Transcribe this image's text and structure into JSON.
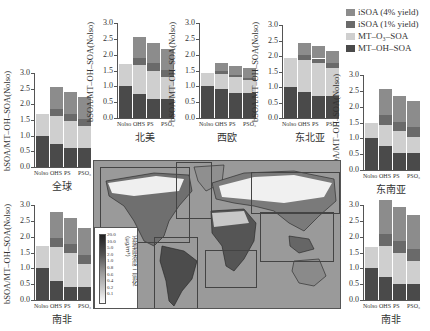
{
  "legend": {
    "items": [
      {
        "label": "iSOA (4% yield)",
        "color": "#8c8c8c"
      },
      {
        "label": "iSOA (1% yield)",
        "color": "#6a6a6a"
      },
      {
        "label": "MT–O₃–SOA",
        "color": "#cfcfcf"
      },
      {
        "label": "MT–OH–SOA",
        "color": "#4a4a4a"
      }
    ]
  },
  "axis": {
    "ylabel": "bSOA/MT–OH–SOA(Nolso)",
    "ylabel_alt": "BSOA/MT–OH–SOA(Nolso)",
    "yticks": [
      "0.0",
      "0.5",
      "1.0",
      "1.5",
      "2.0",
      "2.5",
      "3.0"
    ],
    "xticks": [
      "Nolso",
      "OHS",
      "PS",
      "PSO₃"
    ]
  },
  "map": {
    "colorbar_ticks": [
      "20.0",
      "10.0",
      "5.0",
      "2.0",
      "1.0",
      "0.8",
      "0.6",
      "0.4",
      "0.2",
      "0.1"
    ],
    "colorbar_label": "近地面浓度 二氧化 (μg/m³)"
  },
  "chart_data": [
    {
      "type": "bar",
      "stacked": true,
      "title": "全球",
      "ylabel": "bSOA/MT–OH–SOA(Nolso)",
      "categories": [
        "Nolso",
        "OHS",
        "PS",
        "PSO₃"
      ],
      "ylim": [
        0,
        3.0
      ],
      "series": [
        {
          "name": "MT–OH–SOA",
          "values": [
            1.0,
            0.75,
            0.6,
            0.6
          ]
        },
        {
          "name": "MT–O₃–SOA",
          "values": [
            0.68,
            0.88,
            0.88,
            0.7
          ]
        },
        {
          "name": "iSOA (1% yield)",
          "values": [
            0,
            0.22,
            0.22,
            0.23
          ]
        },
        {
          "name": "iSOA (4% yield)",
          "values": [
            0,
            0.7,
            0.7,
            0.7
          ]
        }
      ]
    },
    {
      "type": "bar",
      "stacked": true,
      "title": "北美",
      "ylabel": "bSOA/MT–OH–SOA(Nolso)",
      "categories": [
        "Nolso",
        "OHS",
        "PS",
        "PSO₃"
      ],
      "ylim": [
        0,
        3.0
      ],
      "series": [
        {
          "name": "MT–OH–SOA",
          "values": [
            1.0,
            0.75,
            0.6,
            0.6
          ]
        },
        {
          "name": "MT–O₃–SOA",
          "values": [
            0.7,
            0.92,
            0.9,
            0.7
          ]
        },
        {
          "name": "iSOA (1% yield)",
          "values": [
            0,
            0.23,
            0.23,
            0.23
          ]
        },
        {
          "name": "iSOA (4% yield)",
          "values": [
            0,
            0.65,
            0.65,
            0.65
          ]
        }
      ]
    },
    {
      "type": "bar",
      "stacked": true,
      "title": "西欧",
      "ylabel": "bSOA/MT–OH–SOA(Nolso)",
      "categories": [
        "Nolso",
        "OHS",
        "PS",
        "PSO₃"
      ],
      "ylim": [
        0,
        3.0
      ],
      "series": [
        {
          "name": "MT–OH–SOA",
          "values": [
            1.0,
            0.92,
            0.8,
            0.8
          ]
        },
        {
          "name": "MT–O₃–SOA",
          "values": [
            0.42,
            0.48,
            0.48,
            0.4
          ]
        },
        {
          "name": "iSOA (1% yield)",
          "values": [
            0,
            0.07,
            0.07,
            0.07
          ]
        },
        {
          "name": "iSOA (4% yield)",
          "values": [
            0,
            0.28,
            0.28,
            0.3
          ]
        }
      ]
    },
    {
      "type": "bar",
      "stacked": true,
      "title": "东北亚",
      "ylabel": "bSOA/MT–OH–SOA(Nolso)",
      "categories": [
        "Nolso",
        "OHS",
        "PS",
        "PSO₃"
      ],
      "ylim": [
        0,
        3.0
      ],
      "series": [
        {
          "name": "MT–OH–SOA",
          "values": [
            1.0,
            0.85,
            0.72,
            0.72
          ]
        },
        {
          "name": "MT–O₃–SOA",
          "values": [
            0.92,
            1.03,
            1.05,
            0.9
          ]
        },
        {
          "name": "iSOA (1% yield)",
          "values": [
            0,
            0.15,
            0.15,
            0.15
          ]
        },
        {
          "name": "iSOA (4% yield)",
          "values": [
            0,
            0.4,
            0.4,
            0.4
          ]
        }
      ]
    },
    {
      "type": "bar",
      "stacked": true,
      "title": "东南亚",
      "ylabel": "bSOA/MT–OH–SOA(Nolso)",
      "categories": [
        "Nolso",
        "OHS",
        "PS",
        "PSO₃"
      ],
      "ylim": [
        0,
        3.0
      ],
      "series": [
        {
          "name": "MT–OH–SOA",
          "values": [
            1.0,
            0.75,
            0.55,
            0.55
          ]
        },
        {
          "name": "MT–O₃–SOA",
          "values": [
            0.5,
            0.68,
            0.68,
            0.5
          ]
        },
        {
          "name": "iSOA (1% yield)",
          "values": [
            0,
            0.3,
            0.3,
            0.3
          ]
        },
        {
          "name": "iSOA (4% yield)",
          "values": [
            0,
            0.82,
            0.82,
            0.82
          ]
        }
      ]
    },
    {
      "type": "bar",
      "stacked": true,
      "title": "南非",
      "ylabel": "bSOA/MT–OH–SOA(Nolso)",
      "categories": [
        "Nolso",
        "OHS",
        "PS",
        "PSO₃"
      ],
      "ylim": [
        0,
        3.0
      ],
      "series": [
        {
          "name": "MT–OH–SOA",
          "values": [
            1.0,
            0.6,
            0.4,
            0.4
          ]
        },
        {
          "name": "MT–O₃–SOA",
          "values": [
            0.72,
            1.07,
            1.08,
            0.75
          ]
        },
        {
          "name": "iSOA (1% yield)",
          "values": [
            0,
            0.28,
            0.28,
            0.28
          ]
        },
        {
          "name": "iSOA (4% yield)",
          "values": [
            0,
            0.83,
            0.83,
            0.83
          ]
        }
      ]
    },
    {
      "type": "bar",
      "stacked": true,
      "title": "南非",
      "ylabel": "BSOA/MT–OH–SOA(Nolso)",
      "categories": [
        "Nolso",
        "OHS",
        "PS",
        "PSO₃"
      ],
      "ylim": [
        0,
        3.0
      ],
      "series": [
        {
          "name": "MT–OH–SOA",
          "values": [
            1.0,
            0.72,
            0.52,
            0.52
          ]
        },
        {
          "name": "MT–O₃–SOA",
          "values": [
            0.67,
            0.98,
            0.98,
            0.72
          ]
        },
        {
          "name": "iSOA (1% yield)",
          "values": [
            0,
            0.37,
            0.37,
            0.38
          ]
        },
        {
          "name": "iSOA (4% yield)",
          "values": [
            0,
            1.08,
            1.08,
            1.08
          ]
        }
      ]
    }
  ]
}
